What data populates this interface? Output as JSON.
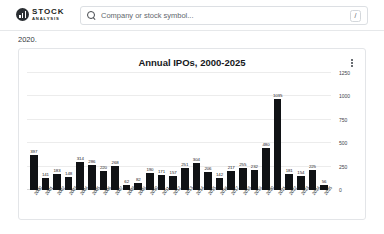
{
  "header": {
    "logo": {
      "icon": "bar-chart-circle-icon",
      "line1": "STOCK",
      "line2": "ANALYSIS"
    },
    "search": {
      "icon": "search-icon",
      "placeholder": "Company or stock symbol...",
      "value": "",
      "shortcut_key": "/"
    }
  },
  "page": {
    "text_fragment": "2020."
  },
  "card": {
    "title": "Annual IPOs, 2000-2025",
    "menu_icon": "kebab-menu-icon"
  },
  "chart_data": {
    "type": "bar",
    "title": "Annual IPOs, 2000-2025",
    "xlabel": "",
    "ylabel": "",
    "ylim": [
      0,
      1250
    ],
    "yticks": [
      0,
      250,
      500,
      750,
      1000,
      1250
    ],
    "ytick_labels": [
      "0",
      "250",
      "500",
      "750",
      "1000",
      "1250"
    ],
    "grid": true,
    "legend": "none",
    "bar_color": "#101215",
    "data_labels": true,
    "categories": [
      "2000",
      "2001",
      "2002",
      "2003",
      "2004",
      "2005",
      "2006",
      "2007",
      "2008",
      "2009",
      "2010",
      "2011",
      "2012",
      "2013",
      "2014",
      "2015",
      "2016",
      "2017",
      "2018",
      "2019",
      "2020",
      "2021",
      "2022",
      "2023",
      "2024",
      "2025"
    ],
    "values": [
      397,
      141,
      183,
      148,
      314,
      286,
      220,
      268,
      62,
      82,
      190,
      171,
      157,
      251,
      304,
      206,
      142,
      217,
      255,
      232,
      480,
      1035,
      181,
      154,
      225,
      56
    ]
  }
}
